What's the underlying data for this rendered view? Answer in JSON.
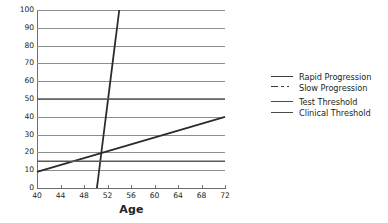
{
  "chart_data": {
    "type": "line",
    "title": "",
    "subtitle": "",
    "xlabel": "Age",
    "ylabel": "",
    "xlim": [
      40,
      72
    ],
    "ylim": [
      0,
      100
    ],
    "grid": true,
    "legend_position": "right",
    "x_ticks": [
      40,
      44,
      48,
      52,
      56,
      60,
      64,
      68,
      72
    ],
    "x_tick_labels": [
      "40",
      "44",
      "48",
      "52",
      "56",
      "60",
      "64",
      "68",
      "72"
    ],
    "y_ticks": [
      0,
      10,
      20,
      30,
      40,
      50,
      60,
      70,
      80,
      90,
      100
    ],
    "y_tick_labels": [
      "0",
      "10",
      "20",
      "30",
      "40",
      "50",
      "60",
      "70",
      "80",
      "90",
      "100"
    ],
    "series": [
      {
        "name": "Rapid Progression",
        "style": "solid",
        "color": "#2b2b2b",
        "width": 1.8,
        "points": [
          [
            50.2,
            0
          ],
          [
            54.0,
            100
          ]
        ]
      },
      {
        "name": "Slow Progression",
        "style": "solid",
        "color": "#2b2b2b",
        "width": 1.8,
        "points": [
          [
            40,
            9
          ],
          [
            72,
            40
          ]
        ]
      },
      {
        "name": "Test Threshold",
        "style": "horizontal",
        "color": "#5a5a5a",
        "width": 1.4,
        "value": 50,
        "points": [
          [
            40,
            50
          ],
          [
            72,
            50
          ]
        ]
      },
      {
        "name": "Clinical Threshold",
        "style": "horizontal",
        "color": "#5a5a5a",
        "width": 1.4,
        "value": 15,
        "points": [
          [
            40,
            15
          ],
          [
            72,
            15
          ]
        ]
      }
    ],
    "annotations": []
  },
  "axes": {
    "x_title": "Age",
    "y_tick_labels": [
      "100",
      "90",
      "80",
      "70",
      "60",
      "50",
      "40",
      "30",
      "20",
      "10",
      "0"
    ],
    "x_tick_labels": [
      "40",
      "44",
      "48",
      "52",
      "56",
      "60",
      "64",
      "68",
      "72"
    ]
  },
  "legend": {
    "items": [
      {
        "label": "Rapid Progression",
        "style": "solid"
      },
      {
        "label": "Slow Progression",
        "style": "dash-dot"
      },
      {
        "label": "Test Threshold",
        "style": "solid"
      },
      {
        "label": "Clinical Threshold",
        "style": "solid"
      }
    ]
  },
  "colors": {
    "series_dark": "#2b2b2b",
    "threshold": "#5a5a5a",
    "gridline": "#8d8e90",
    "axis": "#6d6e71",
    "text": "#231f20",
    "background": "#ffffff"
  }
}
